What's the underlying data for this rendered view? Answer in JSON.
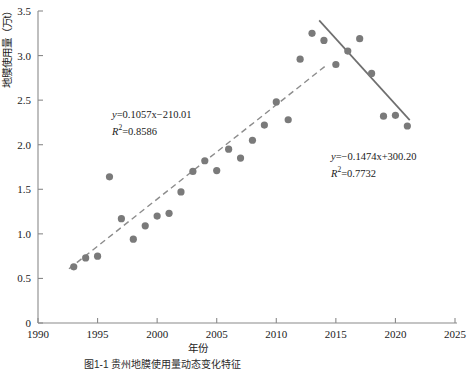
{
  "figure": {
    "xlabel": "年份",
    "ylabel": "地膜使用量（万t）",
    "caption": "图1-1  贵州地膜使用量动态变化特征"
  },
  "annotations": {
    "rising": {
      "equation_y": "y",
      "equation_rest": "=0.1057x−210.01",
      "r2_label": "R",
      "r2_rest": "=0.8586"
    },
    "falling": {
      "equation_y": "y",
      "equation_rest": "=−0.1474x+300.20",
      "r2_label": "R",
      "r2_rest": "=0.7732"
    }
  },
  "colors": {
    "marker": "#7a7a7a",
    "trend_rising": "#8c8c8c",
    "trend_falling": "#6f6f6f",
    "axis": "#8a8a8a",
    "text": "#1a1a1a"
  },
  "chart_data": {
    "type": "scatter",
    "title": "",
    "xlabel": "年份",
    "ylabel": "地膜使用量（万t）",
    "xlim": [
      1990,
      2025
    ],
    "ylim": [
      0,
      3.5
    ],
    "xticks": [
      1990,
      1995,
      2000,
      2005,
      2010,
      2015,
      2020,
      2025
    ],
    "yticks": [
      "0",
      "0.5",
      "1.0",
      "1.5",
      "2.0",
      "2.5",
      "3.0",
      "3.5"
    ],
    "grid": false,
    "legend": "none",
    "x": [
      1993,
      1994,
      1995,
      1996,
      1997,
      1998,
      1999,
      2000,
      2001,
      2002,
      2003,
      2004,
      2005,
      2006,
      2007,
      2008,
      2009,
      2010,
      2011,
      2012,
      2013,
      2014,
      2015,
      2016,
      2017,
      2018,
      2019,
      2020,
      2021
    ],
    "values": [
      0.63,
      0.73,
      0.75,
      1.64,
      1.17,
      0.94,
      1.09,
      1.2,
      1.23,
      1.47,
      1.7,
      1.82,
      1.71,
      1.95,
      1.85,
      2.05,
      2.22,
      2.48,
      2.28,
      2.96,
      3.25,
      3.17,
      2.9,
      3.05,
      3.19,
      2.8,
      2.32,
      2.33,
      2.21
    ],
    "trendlines": [
      {
        "name": "rising",
        "style": "dashed",
        "slope": 0.1057,
        "intercept": -210.01,
        "r2": 0.8586,
        "x_start": 1992.6,
        "x_end": 2014.2
      },
      {
        "name": "falling",
        "style": "solid",
        "slope": -0.1474,
        "intercept": 300.2,
        "r2": 0.7732,
        "x_start": 2013.6,
        "x_end": 2021.2
      }
    ]
  }
}
